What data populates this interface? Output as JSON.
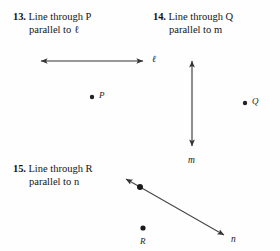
{
  "page": {
    "background_color": "#fefefe",
    "ink_color": "#1a1a1a",
    "width": 280,
    "height": 251
  },
  "exercises": [
    {
      "number": "13.",
      "line1": "Line through P",
      "line2": "parallel to ℓ",
      "point_name": "P",
      "line_name": "ℓ"
    },
    {
      "number": "14.",
      "line1": "Line through Q",
      "line2": "parallel to m",
      "point_name": "Q",
      "line_name": "m"
    },
    {
      "number": "15.",
      "line1": "Line through R",
      "line2": "parallel to n",
      "point_name": "R",
      "line_name": "n"
    }
  ],
  "labels": {
    "point_P": "P",
    "point_Q": "Q",
    "point_R": "R",
    "line_l": "ℓ",
    "line_m": "m",
    "line_n": "n"
  },
  "figures": {
    "line_l": {
      "type": "double-arrow-line",
      "orientation": "horizontal",
      "x1": 36,
      "y1": 61,
      "x2": 148,
      "y2": 61,
      "color": "#333333"
    },
    "point_P": {
      "cx": 92,
      "cy": 97,
      "r": 2.2,
      "color": "#222222"
    },
    "line_m": {
      "type": "double-arrow-line",
      "orientation": "vertical",
      "x1": 192,
      "y1": 56,
      "x2": 192,
      "y2": 151,
      "color": "#333333"
    },
    "point_Q": {
      "cx": 245,
      "cy": 103,
      "r": 2.2,
      "color": "#222222"
    },
    "line_n": {
      "type": "double-arrow-line",
      "orientation": "diagonal",
      "x1": 122,
      "y1": 176,
      "x2": 228,
      "y2": 238,
      "color": "#333333"
    },
    "point_on_n": {
      "cx": 140,
      "cy": 186,
      "r": 3.0,
      "color": "#1a1a1a"
    },
    "point_R": {
      "cx": 143,
      "cy": 228,
      "r": 2.6,
      "color": "#1a1a1a"
    }
  }
}
